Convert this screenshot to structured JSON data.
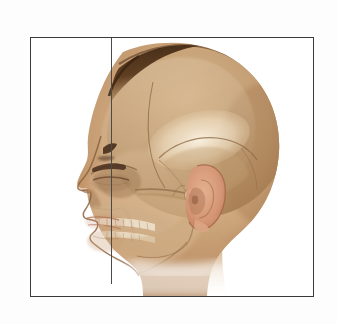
{
  "figure": {
    "title": "Lateral view of human head with skull overlay",
    "orientation": "facing left",
    "frame": {
      "border_color": "#3a3a3a",
      "background_color": "#ffffff",
      "x": 30,
      "y": 37,
      "width": 284,
      "height": 260
    },
    "reference_line": {
      "name": "vertical-reference-line",
      "color": "#4a4a4a",
      "x": 110,
      "y_top": 37,
      "y_bottom": 283,
      "orientation": "vertical"
    },
    "page_background": "#fdfdfd"
  },
  "anatomy": {
    "structures": [
      {
        "id": "scalp-hair",
        "label": "Hair / scalp line",
        "color": "#4a2e1a"
      },
      {
        "id": "cranium",
        "label": "Cranial vault",
        "color": "#c09a70"
      },
      {
        "id": "frontal-bone",
        "label": "Frontal bone",
        "color": "#cbab84"
      },
      {
        "id": "parietal-bone",
        "label": "Parietal bone",
        "color": "#f0e2cb"
      },
      {
        "id": "temporal-bone",
        "label": "Temporal bone",
        "color": "#d9c0a0"
      },
      {
        "id": "orbit",
        "label": "Orbital cavity",
        "color": "#8d6a4a"
      },
      {
        "id": "eyebrow",
        "label": "Eyebrow",
        "color": "#4a3020"
      },
      {
        "id": "eye-closed",
        "label": "Closed eye",
        "color": "#6b4730"
      },
      {
        "id": "nasal-bone",
        "label": "Nasal bone / nose",
        "color": "#c08d66"
      },
      {
        "id": "maxilla",
        "label": "Maxilla",
        "color": "#cdae86"
      },
      {
        "id": "mandible",
        "label": "Mandible",
        "color": "#c9a87f"
      },
      {
        "id": "upper-teeth",
        "label": "Upper dental arch",
        "color": "#efe7d6"
      },
      {
        "id": "lower-teeth",
        "label": "Lower dental arch",
        "color": "#efe7d6"
      },
      {
        "id": "zygomatic-arch",
        "label": "Zygomatic arch",
        "color": "#c7a278"
      },
      {
        "id": "external-ear",
        "label": "External ear (auricle)",
        "color": "#d89878"
      },
      {
        "id": "ear-canal",
        "label": "External acoustic meatus",
        "color": "#a87a56"
      },
      {
        "id": "mastoid-process",
        "label": "Mastoid process",
        "color": "#b8916a"
      },
      {
        "id": "occiput",
        "label": "Occipital region",
        "color": "#b98f64"
      },
      {
        "id": "neck",
        "label": "Neck",
        "color": "#d4b38c"
      },
      {
        "id": "lips",
        "label": "Lips",
        "color": "#c08562"
      },
      {
        "id": "chin",
        "label": "Chin",
        "color": "#c79a70"
      }
    ],
    "palette": {
      "skin_mid": "#c8a177",
      "skin_light": "#e0c4a0",
      "skin_shadow": "#a87c54",
      "skin_deep_shadow": "#8a6340",
      "bone_light": "#f0e2cb",
      "bone_mid": "#cdb18c",
      "bone_shadow": "#9c7c58",
      "hair_dark": "#4a2e1a",
      "ear_pink": "#d89878",
      "outline": "#7a5638"
    }
  }
}
